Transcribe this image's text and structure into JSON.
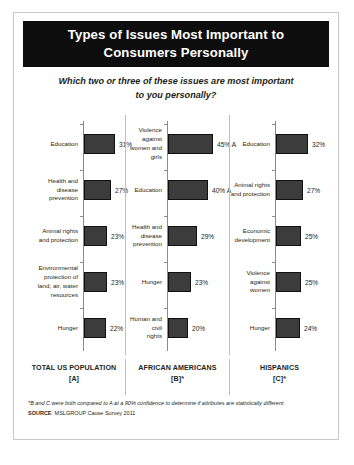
{
  "slide": {
    "title": "Types of Issues Most Important to\nConsumers Personally",
    "subtitle": "Which two or three of these issues are most important\nto you personally?",
    "footnote_note": "*B and C were both compared to A at a 90% confidence to determine if attributes are statistically different",
    "footnote_source_label": "SOURCE",
    "footnote_source_text": ": MSLGROUP Cause Survey 2011",
    "accent_color": "#0d0d0d",
    "bar_color": "#3c3c3c"
  },
  "chart_data": {
    "type": "bar",
    "orientation": "horizontal",
    "title": "Types of Issues Most Important to Consumers Personally",
    "subtitle": "Which two or three of these issues are most important to you personally?",
    "xlabel": "",
    "ylabel": "",
    "xlim": [
      0,
      50
    ],
    "grid": false,
    "legend": "none",
    "value_suffix": "%",
    "panels": [
      {
        "name": "TOTAL US POPULATION",
        "code": "[A]",
        "footer": "TOTAL US POPULATION\n[A]",
        "categories": [
          "Education",
          "Health and\ndisease\nprevention",
          "Animal rights\nand protection",
          "Environmental\nprotection of\nland, air, water\nresources",
          "Hunger"
        ],
        "values": [
          31,
          27,
          23,
          23,
          22
        ],
        "labels": [
          "31%",
          "27%",
          "23%",
          "23%",
          "22%"
        ]
      },
      {
        "name": "AFRICAN AMERICANS",
        "code": "[B]*",
        "footer": "AFRICAN AMERICANS\n[B]*",
        "categories": [
          "Violence against\nwomen and girls",
          "Education",
          "Health and\ndisease\nprevention",
          "Hunger",
          "Human and civil\nrights"
        ],
        "values": [
          45,
          40,
          29,
          23,
          20
        ],
        "labels": [
          "45% A",
          "40% A",
          "29%",
          "23%",
          "20%"
        ]
      },
      {
        "name": "HISPANICS",
        "code": "[C]*",
        "footer": "HISPANICS\n[C]*",
        "categories": [
          "Education",
          "Animal rights\nand protection",
          "Economic\ndevelopment",
          "Violence\nagainst women",
          "Hunger"
        ],
        "values": [
          32,
          27,
          25,
          25,
          24
        ],
        "labels": [
          "32%",
          "27%",
          "25%",
          "25%",
          "24%"
        ]
      }
    ]
  }
}
